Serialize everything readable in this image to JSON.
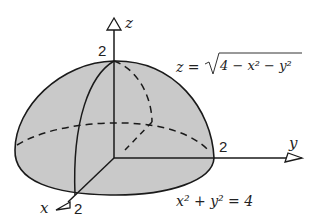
{
  "diagram": {
    "axes": {
      "x": {
        "label": "x",
        "tick": "2"
      },
      "y": {
        "label": "y",
        "tick": "2"
      },
      "z": {
        "label": "z",
        "tick": "2"
      }
    },
    "surface_equation": "z = √(4 − x² − y²)",
    "surface_eq_parts": {
      "lhs": "z =",
      "radicand": "4 − x² − y²"
    },
    "base_equation": "x² + y² = 4",
    "colors": {
      "fill": "#c8c8c8",
      "stroke": "#1a1a1a"
    }
  }
}
